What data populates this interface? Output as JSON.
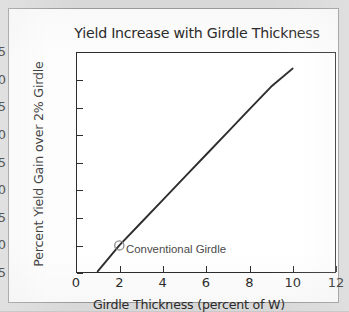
{
  "chart_data": {
    "type": "line",
    "title": "Yield Increase with Girdle Thickness",
    "xlabel": "Girdle Thickness (percent of W)",
    "ylabel": "Percent Yield Gain over 2% Girdle",
    "xlim": [
      0,
      12
    ],
    "ylim": [
      -5,
      35
    ],
    "xticks": [
      0,
      2,
      4,
      6,
      8,
      10,
      12
    ],
    "yticks": [
      -5,
      0,
      5,
      10,
      15,
      20,
      25,
      30,
      35
    ],
    "grid": false,
    "legend": null,
    "series": [
      {
        "name": "Yield gain",
        "x": [
          1,
          2,
          3,
          4,
          5,
          6,
          7,
          8,
          9,
          10
        ],
        "values": [
          -4.7,
          0.0,
          4.1,
          8.2,
          12.3,
          16.4,
          20.5,
          24.6,
          28.7,
          32.0
        ],
        "color": "#2d2d2d"
      }
    ],
    "annotations": [
      {
        "label": "Conventional Girdle",
        "x": 2,
        "y": 0,
        "marker": "open-circle",
        "marker_color": "#8a8a8a"
      }
    ]
  },
  "figure": {
    "panel_background": "#fdfdfd",
    "page_background": "#d8d8d8",
    "frame_color": "#2d2d2d"
  }
}
